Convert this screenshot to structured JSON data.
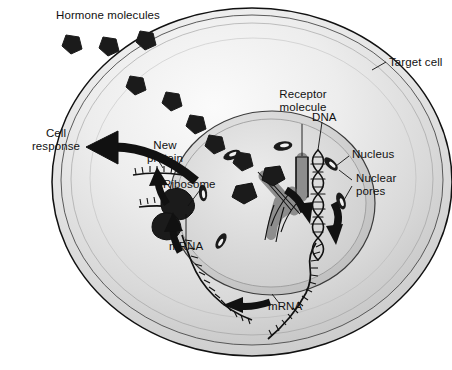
{
  "figure": {
    "type": "biology-diagram",
    "background_color": "#ffffff",
    "ink_color": "#111111"
  },
  "labels": {
    "hormone_molecules": "Hormone molecules",
    "target_cell": "Target cell",
    "cell_response": "Cell\nresponse",
    "new_protein": "New\nprotein",
    "ribosome": "Ribosome",
    "mrna_cytoplasm": "mRNA",
    "mrna_nucleus": "mRNA",
    "receptor_molecule": "Receptor\nmolecule",
    "dna": "DNA",
    "nucleus": "Nucleus",
    "nuclear_pores": "Nuclear\npores"
  },
  "colors": {
    "cytoplasm_light": "#f2f2f2",
    "cytoplasm_mid": "#d8d8d8",
    "cytoplasm_shade": "#c2c2c2",
    "nucleoplasm": "#cfcfcf",
    "nucleoplasm_light": "#e2e2e2",
    "membrane_line": "#111111",
    "hormone_fill": "#1b1b1b",
    "receptor_fill": "#8d8d8d",
    "receptor_stroke": "#111111",
    "arrow_fill": "#111111",
    "pore_fill": "#1b1b1b",
    "leader_line": "#111111"
  },
  "structures": {
    "hormones_outside": [
      {
        "id": "hormone-outside-1",
        "cx": 72,
        "cy": 44
      },
      {
        "id": "hormone-outside-2",
        "cx": 109,
        "cy": 46
      },
      {
        "id": "hormone-outside-3",
        "cx": 146,
        "cy": 40
      }
    ],
    "hormone_on_membrane": {
      "id": "hormone-at-membrane",
      "cx": 136,
      "cy": 84
    },
    "hormones_inside": [
      {
        "id": "hormone-inside-1",
        "cx": 172,
        "cy": 100
      },
      {
        "id": "hormone-inside-2",
        "cx": 196,
        "cy": 123
      },
      {
        "id": "hormone-inside-3",
        "cx": 215,
        "cy": 143
      },
      {
        "id": "hormone-inside-4",
        "cx": 243,
        "cy": 160
      }
    ],
    "receptors": [
      {
        "id": "receptor-1",
        "note": "Y-shaped receptor bound to hormone, upper nucleus"
      },
      {
        "id": "receptor-2",
        "note": "Y-shaped receptor bound to hormone, mid nucleus"
      }
    ],
    "nuclear_pores": [
      {
        "id": "pore-1",
        "cx": 232,
        "cy": 155
      },
      {
        "id": "pore-2",
        "cx": 282,
        "cy": 146
      },
      {
        "id": "pore-3",
        "cx": 330,
        "cy": 163
      },
      {
        "id": "pore-4",
        "cx": 340,
        "cy": 200
      },
      {
        "id": "pore-5",
        "cx": 206,
        "cy": 192
      },
      {
        "id": "pore-6",
        "cx": 223,
        "cy": 240
      }
    ],
    "dna": {
      "id": "dna-double-helix",
      "note": "double helix running down the nucleus centre"
    },
    "ribosome": {
      "id": "ribosome-body",
      "cx": 175,
      "cy": 212
    },
    "mrna_strands": [
      {
        "id": "mrna-nuclear",
        "note": "transcribed strand leaving DNA toward nuclear pore"
      },
      {
        "id": "mrna-cytoplasmic",
        "note": "strand travelling through cytoplasm to ribosome"
      }
    ],
    "new_protein": {
      "id": "new-protein-chain",
      "note": "chain emerging from ribosome"
    },
    "arrows": [
      {
        "id": "arrow-cell-response",
        "direction": "left",
        "note": "thick curved arrow exiting cell to the left"
      },
      {
        "id": "arrow-transcription",
        "direction": "down",
        "note": "inside nucleus beside DNA"
      },
      {
        "id": "arrow-export",
        "direction": "down",
        "note": "mRNA leaving nucleus"
      },
      {
        "id": "arrow-translation",
        "direction": "up",
        "note": "mRNA toward ribosome"
      },
      {
        "id": "arrow-protein-up",
        "direction": "up",
        "note": "new protein from ribosome"
      },
      {
        "id": "arrow-cytoplasm-flow",
        "direction": "left",
        "note": "lower cytoplasm flow arrow"
      }
    ]
  }
}
